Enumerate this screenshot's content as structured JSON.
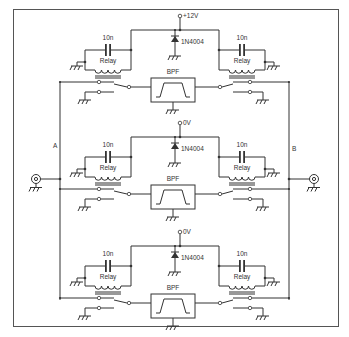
{
  "diagram": {
    "type": "circuit-schematic",
    "ports": {
      "left": "A",
      "right": "B"
    },
    "stages": [
      {
        "supply": "+12V",
        "diode": "1N4004",
        "cap_left": "10n",
        "cap_right": "10n",
        "relay_left": "Relay",
        "relay_right": "Relay",
        "filter": "BPF"
      },
      {
        "supply": "0V",
        "diode": "1N4004",
        "cap_left": "10n",
        "cap_right": "10n",
        "relay_left": "Relay",
        "relay_right": "Relay",
        "filter": "BPF"
      },
      {
        "supply": "0V",
        "diode": "1N4004",
        "cap_left": "10n",
        "cap_right": "10n",
        "relay_left": "Relay",
        "relay_right": "Relay",
        "filter": "BPF"
      }
    ]
  }
}
